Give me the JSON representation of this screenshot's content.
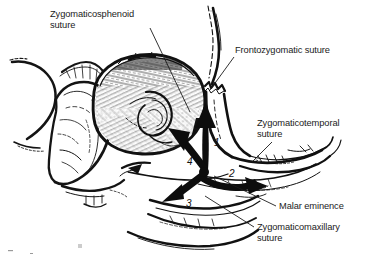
{
  "figure": {
    "type": "anatomical-illustration",
    "background_color": "#ffffff",
    "ink_color": "#111111"
  },
  "labels": [
    {
      "id": "zygomaticosphenoid",
      "text": "Zygomaticosphenoid\nsuture",
      "line1": "Zygomaticosphenoid",
      "line2": "suture",
      "leader_from": [
        150,
        28
      ],
      "leader_to": [
        190,
        112
      ]
    },
    {
      "id": "frontozygomatic",
      "text": "Frontozygomatic suture",
      "line1": "Frontozygomatic suture",
      "line2": "",
      "leader_from": [
        234,
        57
      ],
      "leader_to": [
        210,
        90
      ]
    },
    {
      "id": "zygomaticotemporal",
      "text": "Zygomaticotemporal\nsuture",
      "line1": "Zygomaticotemporal",
      "line2": "suture",
      "leader_from": [
        272,
        142
      ],
      "leader_to": [
        252,
        162
      ]
    },
    {
      "id": "malar-eminence",
      "text": "Malar eminence",
      "line1": "Malar eminence",
      "line2": "",
      "leader_from": [
        276,
        206
      ],
      "leader_to": [
        214,
        176
      ]
    },
    {
      "id": "zygomaticomaxillary",
      "text": "Zygomaticomaxillary\nsuture",
      "line1": "Zygomaticomaxillary",
      "line2": "suture",
      "leader_from": [
        254,
        227
      ],
      "leader_to": [
        205,
        196
      ]
    }
  ],
  "arrows": [
    {
      "id": "arrow-1",
      "number": "1",
      "direction": "up",
      "label_pos": [
        214,
        137
      ]
    },
    {
      "id": "arrow-2",
      "number": "2",
      "direction": "right-down",
      "label_pos": [
        229,
        168
      ]
    },
    {
      "id": "arrow-3",
      "number": "3",
      "direction": "down-left",
      "label_pos": [
        186,
        198
      ]
    },
    {
      "id": "arrow-4",
      "number": "4",
      "direction": "up-left",
      "label_pos": [
        187,
        156
      ]
    }
  ]
}
